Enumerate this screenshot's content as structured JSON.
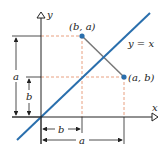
{
  "diagram": {
    "axes": {
      "x_label": "x",
      "y_label": "y"
    },
    "line_label": "y = x",
    "points": [
      {
        "label": "(b, a)",
        "x": 82,
        "y": 36
      },
      {
        "label": "(a, b)",
        "x": 124,
        "y": 77
      }
    ],
    "dimensions": {
      "left_a": "a",
      "left_b": "b",
      "bottom_b": "b",
      "bottom_a": "a"
    },
    "colors": {
      "axis": "#222222",
      "line": "#2a6fad",
      "point": "#2a6fad",
      "dashed": "#e8a080",
      "segment": "#777777",
      "text": "#222222"
    }
  }
}
